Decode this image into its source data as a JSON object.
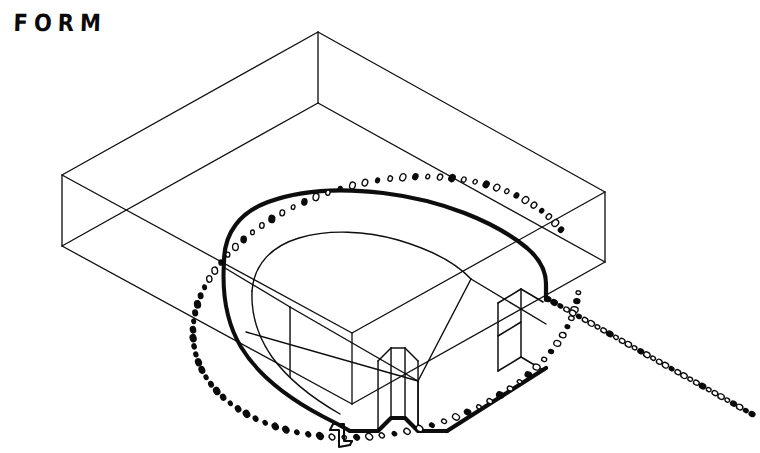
{
  "sheet": {
    "title": "FORM",
    "medium": "hand-drawn ink line drawing",
    "background_color": "#ffffff",
    "ink_color": "#0a0a0a",
    "width": 760,
    "height": 453
  },
  "caption": {
    "text": "FORM",
    "position": "top-left"
  },
  "chart_data": {
    "type": "diagram",
    "title": "FORM",
    "subtitle": "",
    "projection": "axonometric / isometric-like, viewed from above",
    "elements": [
      {
        "name": "bounding-box",
        "kind": "wireframe-rectangular-prism",
        "stroke": "thin",
        "stroke_width": 1,
        "label": "Outer transparent bounding volume"
      },
      {
        "name": "central-form",
        "kind": "rounded-slab",
        "stroke": "bold",
        "stroke_width": 4,
        "label": "Central stadium / U-shaped solid form with notches"
      },
      {
        "name": "inner-contour",
        "kind": "recessed-top-surface",
        "stroke": "thin",
        "stroke_width": 1.4,
        "label": "Inner recessed top contour of the form"
      },
      {
        "name": "orbit-path",
        "kind": "dotted-ellipse",
        "stroke": "dotted",
        "dot_count": 96,
        "label": "Dotted elliptical motion / orbit path around the form"
      },
      {
        "name": "tangent-ray",
        "kind": "dotted-line",
        "stroke": "dotted",
        "dot_count": 34,
        "label": "Dotted straight tangent ray exiting lower-right"
      },
      {
        "name": "direction-marker",
        "kind": "bent-arrow-glyph",
        "stroke": "outline",
        "label": "Small bent hook / direction marker at bottom"
      }
    ],
    "box_vertices": {
      "top_back": [
        318,
        32
      ],
      "top_left": [
        62,
        175
      ],
      "top_right": [
        605,
        192
      ],
      "top_front": [
        352,
        333
      ],
      "bottom_left": [
        62,
        246
      ],
      "bottom_right": [
        605,
        262
      ],
      "bottom_front": [
        352,
        404
      ],
      "bottom_back": [
        318,
        103
      ]
    },
    "legend": [],
    "grid": false
  }
}
